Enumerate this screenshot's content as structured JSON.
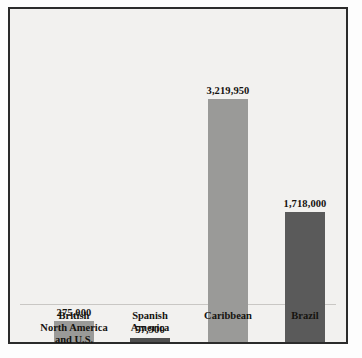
{
  "chart_data": {
    "type": "bar",
    "title": "",
    "subtitle": "",
    "xlabel": "",
    "ylabel": "",
    "ylim": [
      0,
      3500000
    ],
    "grid": false,
    "legend": "none",
    "axis_tick_labels": [],
    "categories": [
      "British\nNorth America\nand U.S.",
      "Spanish\nAmerica",
      "Caribbean",
      "Brazil"
    ],
    "category_lines": [
      [
        "British",
        "North America",
        "and U.S."
      ],
      [
        "Spanish",
        "America"
      ],
      [
        "Caribbean"
      ],
      [
        "Brazil"
      ]
    ],
    "values": [
      275000,
      57900,
      3219950,
      1718000
    ],
    "value_labels": [
      "275,000",
      "57,900",
      "3,219,950",
      "1,718,000"
    ],
    "bar_colors": [
      "#9a9a98",
      "#4f4f4f",
      "#9a9a98",
      "#5a5a5a"
    ]
  },
  "style": {
    "frame_border_color": "#2b2b2b",
    "plot_background": "#f2f1ef",
    "page_background": "#ffffff",
    "baseline_color": "#c9c7c4",
    "label_color": "#15130f"
  }
}
